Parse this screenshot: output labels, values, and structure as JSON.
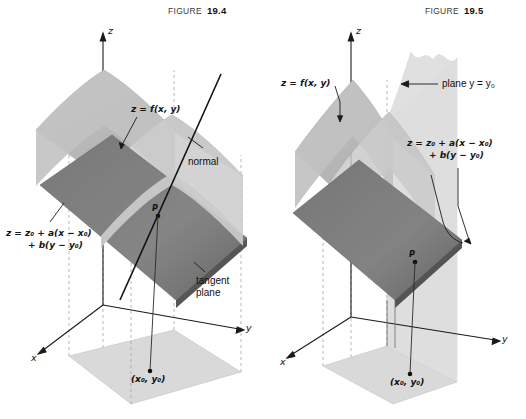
{
  "page": {
    "width": 526,
    "height": 419,
    "background": "#ffffff"
  },
  "figures": [
    {
      "id": "figure-19-4",
      "caption_word": "FIGURE",
      "caption_number": "19.4",
      "labels": {
        "surface": "z = f(x, y)",
        "normal": "normal",
        "tangent_plane": "tangent\nplane",
        "tangent_plane_line1": "tangent",
        "tangent_plane_line2": "plane",
        "plane_eq_line1": "z = z₀ + a(x − x₀)",
        "plane_eq_line2": "+ b(y − y₀)",
        "point_p": "P",
        "base_point": "(x₀, y₀)",
        "axis_x": "x",
        "axis_y": "y",
        "axis_z": "z"
      }
    },
    {
      "id": "figure-19-5",
      "caption_word": "FIGURE",
      "caption_number": "19.5",
      "labels": {
        "surface": "z = f(x, y)",
        "plane_y": "plane  y = y₀",
        "plane_eq_line1": "z = z₀ + a(x − x₀)",
        "plane_eq_line2": "+ b(y − y₀)",
        "point_p": "P",
        "base_point": "(x₀, y₀)",
        "axis_x": "x",
        "axis_y": "y",
        "axis_z": "z"
      }
    }
  ],
  "colors": {
    "surface_light": "#b9b9b9",
    "surface_light_2": "#cccccc",
    "tangent_plane_dark": "#8a8a8a",
    "tangent_plane_dark_2": "#757575",
    "ground_plane": "#d8d8d8",
    "vertical_plane": "#dcdcdc",
    "axis_line": "#1a1a1a",
    "dashed_line": "#9a9a9a",
    "text": "#151515",
    "background": "#ffffff"
  }
}
